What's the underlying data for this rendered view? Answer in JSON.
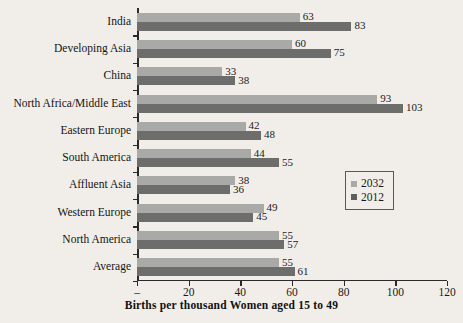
{
  "chart_data": {
    "type": "bar",
    "orientation": "horizontal",
    "title": "",
    "xlabel": "Births per thousand Women aged 15 to 49",
    "ylabel": "",
    "xlim": [
      0,
      120
    ],
    "xticks": [
      "–",
      "20",
      "40",
      "60",
      "80",
      "100",
      "120"
    ],
    "xtick_values": [
      0,
      20,
      40,
      60,
      80,
      100,
      120
    ],
    "grid": false,
    "legend_position": "center-right",
    "categories": [
      "India",
      "Developing Asia",
      "China",
      "North Africa/Middle East",
      "Eastern Europe",
      "South America",
      "Affluent Asia",
      "Western Europe",
      "North America",
      "Average"
    ],
    "series": [
      {
        "name": "2032",
        "color": "#a9a9a7",
        "values": [
          63,
          60,
          33,
          93,
          42,
          44,
          38,
          49,
          55,
          55
        ]
      },
      {
        "name": "2012",
        "color": "#6d6d6c",
        "values": [
          83,
          75,
          38,
          103,
          48,
          55,
          36,
          45,
          57,
          61
        ]
      }
    ]
  },
  "legend": {
    "entries": [
      {
        "label": "2032"
      },
      {
        "label": "2012"
      }
    ]
  }
}
